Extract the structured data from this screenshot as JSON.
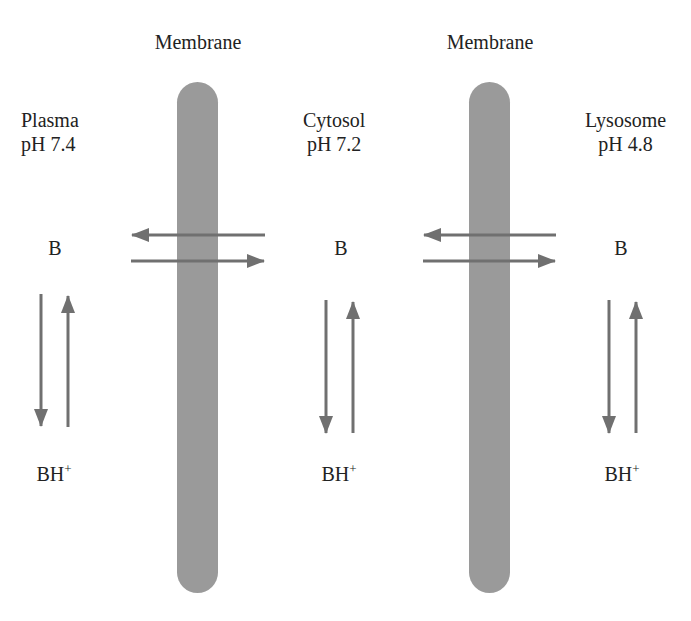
{
  "membranes": [
    {
      "label": "Membrane"
    },
    {
      "label": "Membrane"
    }
  ],
  "compartments": [
    {
      "name": "Plasma",
      "ph": "pH 7.4",
      "neutral": "B",
      "protonated": "BH",
      "charge": "+"
    },
    {
      "name": "Cytosol",
      "ph": "pH 7.2",
      "neutral": "B",
      "protonated": "BH",
      "charge": "+"
    },
    {
      "name": "Lysosome",
      "ph": "pH 4.8",
      "neutral": "B",
      "protonated": "BH",
      "charge": "+"
    }
  ],
  "colors": {
    "membrane": "#9a9a9a",
    "arrow": "#707070",
    "text": "#222222"
  }
}
